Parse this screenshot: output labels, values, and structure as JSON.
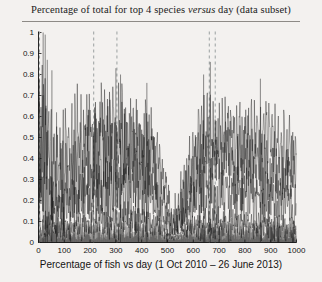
{
  "figure": {
    "title_prefix": "Percentage of total for top 4 species ",
    "title_italic": "versus",
    "title_suffix": " day (data subset)",
    "background_color": "#f3f1ef",
    "line_color": "#1a1a1a",
    "marker_line_color": "#9aa0a0"
  },
  "chart_data": {
    "type": "line",
    "title": "Percentage of total for top 4 species versus day (data subset)",
    "xlabel": "Percentage of fish vs day (1 Oct 2010 – 26 June 2013)",
    "ylabel": "",
    "xlim": [
      0,
      1000
    ],
    "ylim": [
      0,
      1
    ],
    "grid": false,
    "legend": "none",
    "xticks": [
      0,
      100,
      200,
      300,
      400,
      500,
      600,
      700,
      800,
      900,
      1000
    ],
    "yticks": [
      0,
      0.1,
      0.2,
      0.3,
      0.4,
      0.5,
      0.6,
      0.7,
      0.8,
      0.9,
      1
    ],
    "xtick_labels": [
      "0",
      "100",
      "200",
      "300",
      "400",
      "500",
      "600",
      "700",
      "800",
      "900",
      "1000"
    ],
    "ytick_labels": [
      "0",
      "0.1",
      "0.2",
      "0.3",
      "0.4",
      "0.5",
      "0.6",
      "0.7",
      "0.8",
      "0.9",
      "1"
    ],
    "annotations": [
      {
        "type": "vertical-dashed-line",
        "x": 4,
        "label": "season-marker-1"
      },
      {
        "type": "vertical-dashed-line",
        "x": 214,
        "label": "season-marker-2"
      },
      {
        "type": "vertical-dashed-line",
        "x": 304,
        "label": "season-marker-3"
      },
      {
        "type": "vertical-dashed-line",
        "x": 662,
        "label": "season-marker-4"
      },
      {
        "type": "vertical-dashed-line",
        "x": 685,
        "label": "season-marker-5"
      }
    ],
    "series": [
      {
        "name": "species-1",
        "color": "#1a1a1a",
        "envelope": [
          {
            "x": 0,
            "low": 0.18,
            "high": 1.0
          },
          {
            "x": 60,
            "low": 0.05,
            "high": 0.62
          },
          {
            "x": 150,
            "low": 0.12,
            "high": 0.78
          },
          {
            "x": 230,
            "low": 0.22,
            "high": 0.8
          },
          {
            "x": 330,
            "low": 0.25,
            "high": 0.78
          },
          {
            "x": 420,
            "low": 0.2,
            "high": 0.75
          },
          {
            "x": 470,
            "low": 0.1,
            "high": 0.55
          },
          {
            "x": 520,
            "low": 0.02,
            "high": 0.2
          },
          {
            "x": 570,
            "low": 0.05,
            "high": 0.45
          },
          {
            "x": 620,
            "low": 0.2,
            "high": 0.72
          },
          {
            "x": 700,
            "low": 0.3,
            "high": 0.72
          },
          {
            "x": 800,
            "low": 0.22,
            "high": 0.7
          },
          {
            "x": 900,
            "low": 0.25,
            "high": 0.68
          },
          {
            "x": 1000,
            "low": 0.18,
            "high": 0.6
          }
        ]
      },
      {
        "name": "species-2",
        "color": "#1a1a1a",
        "envelope": [
          {
            "x": 0,
            "low": 0.1,
            "high": 0.92
          },
          {
            "x": 60,
            "low": 0.02,
            "high": 0.45
          },
          {
            "x": 150,
            "low": 0.05,
            "high": 0.6
          },
          {
            "x": 230,
            "low": 0.1,
            "high": 0.7
          },
          {
            "x": 330,
            "low": 0.15,
            "high": 0.7
          },
          {
            "x": 420,
            "low": 0.12,
            "high": 0.66
          },
          {
            "x": 470,
            "low": 0.06,
            "high": 0.42
          },
          {
            "x": 520,
            "low": 0.01,
            "high": 0.12
          },
          {
            "x": 570,
            "low": 0.03,
            "high": 0.35
          },
          {
            "x": 620,
            "low": 0.12,
            "high": 0.62
          },
          {
            "x": 700,
            "low": 0.2,
            "high": 0.62
          },
          {
            "x": 800,
            "low": 0.14,
            "high": 0.58
          },
          {
            "x": 900,
            "low": 0.16,
            "high": 0.56
          },
          {
            "x": 1000,
            "low": 0.1,
            "high": 0.5
          }
        ]
      },
      {
        "name": "species-3",
        "color": "#1a1a1a",
        "envelope": [
          {
            "x": 0,
            "low": 0.03,
            "high": 0.55
          },
          {
            "x": 60,
            "low": 0.01,
            "high": 0.25
          },
          {
            "x": 150,
            "low": 0.02,
            "high": 0.34
          },
          {
            "x": 230,
            "low": 0.04,
            "high": 0.44
          },
          {
            "x": 330,
            "low": 0.05,
            "high": 0.46
          },
          {
            "x": 420,
            "low": 0.04,
            "high": 0.42
          },
          {
            "x": 470,
            "low": 0.02,
            "high": 0.28
          },
          {
            "x": 520,
            "low": 0.0,
            "high": 0.08
          },
          {
            "x": 570,
            "low": 0.01,
            "high": 0.22
          },
          {
            "x": 620,
            "low": 0.04,
            "high": 0.4
          },
          {
            "x": 700,
            "low": 0.08,
            "high": 0.42
          },
          {
            "x": 800,
            "low": 0.05,
            "high": 0.38
          },
          {
            "x": 900,
            "low": 0.06,
            "high": 0.36
          },
          {
            "x": 1000,
            "low": 0.03,
            "high": 0.3
          }
        ]
      },
      {
        "name": "species-4",
        "color": "#1a1a1a",
        "envelope": [
          {
            "x": 0,
            "low": 0.0,
            "high": 0.22
          },
          {
            "x": 60,
            "low": 0.0,
            "high": 0.12
          },
          {
            "x": 150,
            "low": 0.0,
            "high": 0.14
          },
          {
            "x": 230,
            "low": 0.0,
            "high": 0.18
          },
          {
            "x": 330,
            "low": 0.0,
            "high": 0.2
          },
          {
            "x": 420,
            "low": 0.0,
            "high": 0.18
          },
          {
            "x": 470,
            "low": 0.0,
            "high": 0.12
          },
          {
            "x": 520,
            "low": 0.0,
            "high": 0.04
          },
          {
            "x": 570,
            "low": 0.0,
            "high": 0.1
          },
          {
            "x": 620,
            "low": 0.0,
            "high": 0.16
          },
          {
            "x": 700,
            "low": 0.0,
            "high": 0.18
          },
          {
            "x": 800,
            "low": 0.0,
            "high": 0.16
          },
          {
            "x": 900,
            "low": 0.0,
            "high": 0.15
          },
          {
            "x": 1000,
            "low": 0.0,
            "high": 0.12
          }
        ]
      }
    ],
    "spikes": [
      {
        "x": 18,
        "y": 1.0
      },
      {
        "x": 26,
        "y": 0.99
      },
      {
        "x": 34,
        "y": 0.87
      },
      {
        "x": 52,
        "y": 0.82
      },
      {
        "x": 70,
        "y": 0.62
      },
      {
        "x": 300,
        "y": 0.83
      },
      {
        "x": 318,
        "y": 0.8
      },
      {
        "x": 420,
        "y": 0.76
      },
      {
        "x": 640,
        "y": 0.8
      },
      {
        "x": 666,
        "y": 0.86
      },
      {
        "x": 860,
        "y": 0.78
      }
    ]
  },
  "axis": {
    "x_label": "Percentage of fish vs day (1 Oct 2010 – 26 June 2013)"
  }
}
